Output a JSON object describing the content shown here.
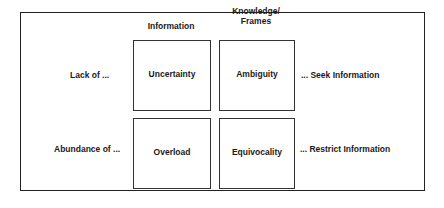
{
  "diagram": {
    "column_headers": [
      "Information",
      "Knowledge/\nFrames"
    ],
    "column_header_lines": {
      "information": "Information",
      "knowledge_line1": "Knowledge/",
      "knowledge_line2": "Frames"
    },
    "rows": [
      {
        "label": "Lack of ...",
        "cells": [
          "Uncertainty",
          "Ambiguity"
        ],
        "outcome": "... Seek Information"
      },
      {
        "label": "Abundance of ...",
        "cells": [
          "Overload",
          "Equivocality"
        ],
        "outcome": "... Restrict Information"
      }
    ]
  }
}
